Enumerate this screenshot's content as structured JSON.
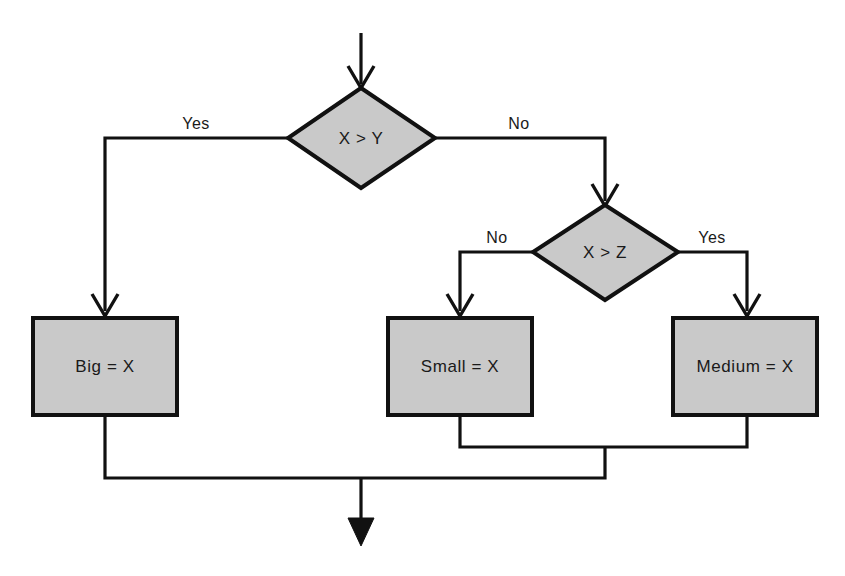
{
  "diagram": {
    "type": "flowchart",
    "canvas": {
      "width": 845,
      "height": 576
    },
    "colors": {
      "shape_fill": "#c9c9c9",
      "shape_stroke": "#111111",
      "connector": "#111111",
      "background": "#ffffff",
      "text": "#1a1a1a"
    },
    "nodes": [
      {
        "id": "decision_xy",
        "shape": "diamond",
        "label": "X > Y",
        "center_x": 361,
        "center_y": 138
      },
      {
        "id": "decision_xz",
        "shape": "diamond",
        "label": "X > Z",
        "center_x": 605,
        "center_y": 252
      },
      {
        "id": "process_big",
        "shape": "rectangle",
        "label": "Big = X",
        "center_x": 105,
        "center_y": 366
      },
      {
        "id": "process_small",
        "shape": "rectangle",
        "label": "Small = X",
        "center_x": 460,
        "center_y": 366
      },
      {
        "id": "process_medium",
        "shape": "rectangle",
        "label": "Medium = X",
        "center_x": 745,
        "center_y": 366
      }
    ],
    "edges": [
      {
        "id": "edge_entry",
        "from": "start",
        "to": "decision_xy",
        "label": ""
      },
      {
        "id": "edge_xy_yes",
        "from": "decision_xy",
        "to": "process_big",
        "label": "Yes",
        "label_x": 196,
        "label_y": 129
      },
      {
        "id": "edge_xy_no",
        "from": "decision_xy",
        "to": "decision_xz",
        "label": "No",
        "label_x": 519,
        "label_y": 129
      },
      {
        "id": "edge_xz_no",
        "from": "decision_xz",
        "to": "process_small",
        "label": "No",
        "label_x": 497,
        "label_y": 243
      },
      {
        "id": "edge_xz_yes",
        "from": "decision_xz",
        "to": "process_medium",
        "label": "Yes",
        "label_x": 712,
        "label_y": 243
      },
      {
        "id": "edge_small_merge",
        "from": "process_small",
        "to": "merge_lower",
        "label": ""
      },
      {
        "id": "edge_medium_merge",
        "from": "process_medium",
        "to": "merge_lower",
        "label": ""
      },
      {
        "id": "edge_big_merge",
        "from": "process_big",
        "to": "merge_final",
        "label": ""
      },
      {
        "id": "edge_exit",
        "from": "merge_final",
        "to": "end",
        "label": ""
      }
    ]
  }
}
